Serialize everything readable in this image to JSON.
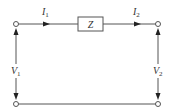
{
  "diagram": {
    "type": "two-port circuit",
    "component": {
      "label": "Z"
    },
    "currents": [
      {
        "symbol": "I",
        "subscript": "1",
        "direction": "right"
      },
      {
        "symbol": "I",
        "subscript": "2",
        "direction": "right"
      }
    ],
    "voltages": [
      {
        "symbol": "V",
        "subscript": "1",
        "side": "left"
      },
      {
        "symbol": "V",
        "subscript": "2",
        "side": "right"
      }
    ],
    "colors": {
      "wire": "#555555",
      "arrow": "#222222",
      "text": "#333333",
      "background": "#ffffff"
    }
  }
}
